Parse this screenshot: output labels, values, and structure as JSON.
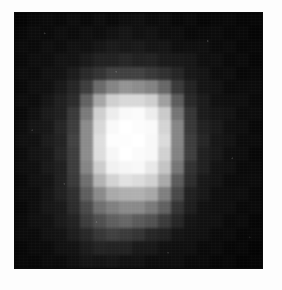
{
  "figure": {
    "kind": "grayscale-pixel-image",
    "caption": "",
    "frame": {
      "left": 15,
      "top": 13,
      "width": 247,
      "height": 255,
      "background_color": "#050505",
      "border_color": "#0a0a0a"
    },
    "page_background_color": "#fdfdfd"
  },
  "chart_data": {
    "type": "heatmap",
    "title": "",
    "subtitle": "",
    "xlabel": "",
    "ylabel": "",
    "colormap": "grayscale",
    "grid": false,
    "legend": "none",
    "colorbar": false,
    "xtick_labels": [],
    "ytick_labels": [],
    "value_range": [
      0,
      255
    ],
    "cols": 19,
    "rows": 19,
    "note": "Each value is the 8-bit gray level of one displayed pixel block, row-major from top-left.",
    "values": [
      [
        8,
        10,
        9,
        10,
        12,
        11,
        13,
        12,
        14,
        13,
        12,
        11,
        10,
        10,
        9,
        9,
        8,
        8,
        7
      ],
      [
        9,
        11,
        12,
        13,
        14,
        15,
        16,
        17,
        18,
        17,
        16,
        15,
        13,
        12,
        11,
        10,
        10,
        9,
        8
      ],
      [
        10,
        12,
        14,
        15,
        17,
        19,
        21,
        23,
        24,
        23,
        22,
        20,
        17,
        15,
        13,
        12,
        11,
        10,
        9
      ],
      [
        11,
        13,
        16,
        18,
        21,
        25,
        30,
        34,
        36,
        35,
        33,
        29,
        24,
        19,
        16,
        14,
        12,
        11,
        10
      ],
      [
        12,
        14,
        17,
        21,
        27,
        38,
        52,
        62,
        66,
        64,
        59,
        48,
        34,
        24,
        18,
        15,
        13,
        11,
        10
      ],
      [
        12,
        15,
        19,
        24,
        34,
        62,
        104,
        134,
        146,
        143,
        130,
        100,
        58,
        32,
        22,
        17,
        14,
        12,
        10
      ],
      [
        13,
        16,
        21,
        28,
        44,
        96,
        168,
        206,
        219,
        216,
        203,
        160,
        90,
        42,
        26,
        19,
        15,
        12,
        11
      ],
      [
        13,
        17,
        23,
        32,
        55,
        124,
        206,
        240,
        249,
        248,
        238,
        200,
        118,
        52,
        30,
        21,
        16,
        13,
        11
      ],
      [
        14,
        18,
        24,
        35,
        62,
        138,
        219,
        249,
        253,
        253,
        248,
        214,
        132,
        58,
        33,
        22,
        17,
        13,
        11
      ],
      [
        14,
        18,
        25,
        36,
        64,
        142,
        222,
        250,
        254,
        254,
        250,
        218,
        136,
        60,
        34,
        23,
        17,
        14,
        11
      ],
      [
        14,
        18,
        25,
        36,
        64,
        140,
        218,
        248,
        253,
        253,
        247,
        212,
        130,
        58,
        33,
        22,
        17,
        13,
        11
      ],
      [
        13,
        18,
        24,
        34,
        60,
        130,
        205,
        239,
        248,
        247,
        236,
        196,
        114,
        50,
        30,
        21,
        16,
        13,
        11
      ],
      [
        13,
        17,
        23,
        32,
        54,
        112,
        176,
        212,
        224,
        222,
        208,
        166,
        92,
        42,
        26,
        19,
        15,
        12,
        10
      ],
      [
        13,
        17,
        22,
        30,
        48,
        92,
        140,
        168,
        178,
        176,
        164,
        128,
        70,
        34,
        23,
        18,
        14,
        12,
        10
      ],
      [
        12,
        16,
        21,
        28,
        43,
        76,
        110,
        130,
        138,
        134,
        122,
        94,
        54,
        29,
        21,
        16,
        13,
        11,
        10
      ],
      [
        12,
        15,
        20,
        26,
        38,
        62,
        84,
        96,
        100,
        92,
        80,
        62,
        38,
        24,
        18,
        15,
        12,
        11,
        9
      ],
      [
        11,
        14,
        18,
        23,
        31,
        46,
        58,
        64,
        62,
        52,
        42,
        34,
        25,
        19,
        15,
        13,
        11,
        10,
        9
      ],
      [
        10,
        12,
        15,
        19,
        24,
        31,
        36,
        38,
        35,
        29,
        25,
        21,
        17,
        14,
        12,
        11,
        10,
        9,
        8
      ],
      [
        9,
        11,
        13,
        15,
        18,
        21,
        23,
        23,
        21,
        19,
        17,
        15,
        13,
        12,
        10,
        10,
        9,
        8,
        8
      ]
    ]
  }
}
